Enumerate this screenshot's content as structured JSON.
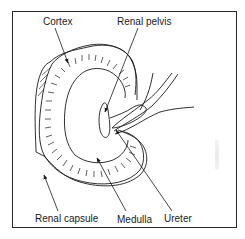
{
  "diagram": {
    "labels": {
      "cortex": "Cortex",
      "renal_pelvis": "Renal pelvis",
      "renal_capsule": "Renal capsule",
      "medulla": "Medulla",
      "ureter": "Ureter"
    },
    "colors": {
      "line": "#1a1a1a",
      "background": "#ffffff",
      "frame": "#2a2a2a"
    }
  }
}
